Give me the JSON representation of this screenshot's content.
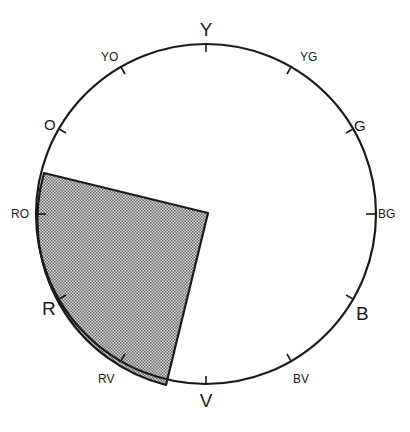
{
  "diagram": {
    "type": "color-wheel",
    "center": [
      206,
      214
    ],
    "radius": 170,
    "colors": {
      "stroke": "#1a1a1a",
      "shade": "#9a9a9a",
      "background": "#ffffff"
    },
    "hues": [
      {
        "key": "Y",
        "label": "Y",
        "primary": true,
        "angle": 0
      },
      {
        "key": "YG",
        "label": "YG",
        "primary": false,
        "angle": 30
      },
      {
        "key": "G",
        "label": "G",
        "primary": false,
        "angle": 60
      },
      {
        "key": "BG",
        "label": "BG",
        "primary": false,
        "angle": 90
      },
      {
        "key": "B",
        "label": "B",
        "primary": true,
        "angle": 120
      },
      {
        "key": "BV",
        "label": "BV",
        "primary": false,
        "angle": 150
      },
      {
        "key": "V",
        "label": "V",
        "primary": true,
        "angle": 180
      },
      {
        "key": "RV",
        "label": "RV",
        "primary": false,
        "angle": 210
      },
      {
        "key": "R",
        "label": "R",
        "primary": true,
        "angle": 240
      },
      {
        "key": "RO",
        "label": "RO",
        "primary": false,
        "angle": 270
      },
      {
        "key": "O",
        "label": "O",
        "primary": false,
        "angle": 300
      },
      {
        "key": "YO",
        "label": "YO",
        "primary": false,
        "angle": 330
      }
    ],
    "shaded_sector": {
      "description": "Shaded wedge spanning from just below O through RO and R to just before V",
      "from_hue": "RV-V",
      "to_hue": "O-RO"
    }
  }
}
